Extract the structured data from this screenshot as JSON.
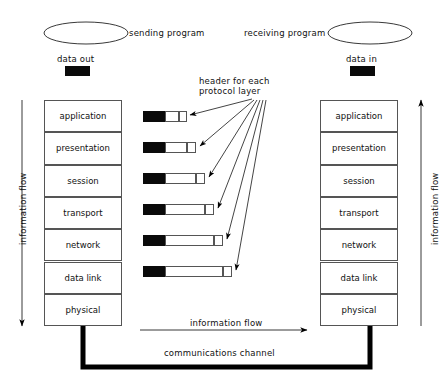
{
  "diagram": {
    "sending_program_label": "sending program",
    "receiving_program_label": "receiving program",
    "data_out_label": "data  out",
    "data_in_label": "data in",
    "header_note_line1": "header for each",
    "header_note_line2": "protocol layer",
    "information_flow_left": "information flow",
    "information_flow_right": "information flow",
    "information_flow_bottom": "information flow",
    "communications_channel_label": "communications channel",
    "colors": {
      "ink": "#000000",
      "box_stroke": "#555555",
      "header_fill": "#0a0a0a",
      "background": "#ffffff"
    },
    "layers_left": [
      {
        "label": "application"
      },
      {
        "label": "presentation"
      },
      {
        "label": "session"
      },
      {
        "label": "transport"
      },
      {
        "label": "network"
      },
      {
        "label": "data link"
      },
      {
        "label": "physical"
      }
    ],
    "layers_right": [
      {
        "label": "application"
      },
      {
        "label": "presentation"
      },
      {
        "label": "session"
      },
      {
        "label": "transport"
      },
      {
        "label": "network"
      },
      {
        "label": "data link"
      },
      {
        "label": "physical"
      }
    ],
    "packets": [
      {
        "layer": "application",
        "header_width": 22,
        "body_width": 14,
        "tail_width": 8,
        "total_width": 44
      },
      {
        "layer": "presentation",
        "header_width": 22,
        "body_width": 22,
        "tail_width": 9,
        "total_width": 53
      },
      {
        "layer": "session",
        "header_width": 22,
        "body_width": 31,
        "tail_width": 9,
        "total_width": 62
      },
      {
        "layer": "transport",
        "header_width": 22,
        "body_width": 40,
        "tail_width": 9,
        "total_width": 71
      },
      {
        "layer": "network",
        "header_width": 22,
        "body_width": 49,
        "tail_width": 9,
        "total_width": 80
      },
      {
        "layer": "data link",
        "header_width": 22,
        "body_width": 58,
        "tail_width": 9,
        "total_width": 89
      }
    ]
  }
}
